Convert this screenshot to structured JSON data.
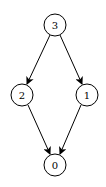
{
  "diagram": {
    "type": "directed-graph",
    "nodes": [
      {
        "id": "3",
        "label": "3",
        "x": 55,
        "y": 25
      },
      {
        "id": "2",
        "label": "2",
        "x": 22,
        "y": 95
      },
      {
        "id": "1",
        "label": "1",
        "x": 87,
        "y": 95
      },
      {
        "id": "0",
        "label": "0",
        "x": 55,
        "y": 165
      }
    ],
    "edges": [
      {
        "from": "3",
        "to": "2"
      },
      {
        "from": "3",
        "to": "1"
      },
      {
        "from": "2",
        "to": "0"
      },
      {
        "from": "1",
        "to": "0"
      }
    ],
    "node_radius": 11,
    "colors": {
      "stroke": "#000000",
      "fill": "#ffffff"
    }
  }
}
